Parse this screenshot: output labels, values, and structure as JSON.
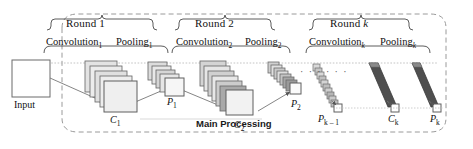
{
  "diagram": {
    "title": "Main Processing",
    "type": "cnn-architecture",
    "container_label": "Main Processing",
    "input": {
      "label": "Input"
    },
    "rounds": [
      {
        "id": "round-1",
        "label": "Round  1",
        "stages": [
          {
            "name": "Convolution",
            "subscript": "1"
          },
          {
            "name": "Pooling",
            "subscript": "1"
          }
        ]
      },
      {
        "id": "round-2",
        "label": "Round  2",
        "stages": [
          {
            "name": "Convolution",
            "subscript": "2"
          },
          {
            "name": "Pooling",
            "subscript": "2"
          }
        ]
      },
      {
        "id": "round-k",
        "label": "Round  k",
        "label_prefix": "Round",
        "label_var": "k",
        "stages": [
          {
            "name": "Convolution",
            "subscript": "k"
          },
          {
            "name": "Pooling",
            "subscript": "k"
          }
        ]
      }
    ],
    "nodes": [
      {
        "id": "c1",
        "symbol": "C",
        "subscript": "1"
      },
      {
        "id": "p1",
        "symbol": "P",
        "subscript": "1"
      },
      {
        "id": "c2",
        "symbol": "C",
        "subscript": "2"
      },
      {
        "id": "p2",
        "symbol": "P",
        "subscript": "2"
      },
      {
        "id": "pk1",
        "symbol": "P",
        "subscript": "k – 1"
      },
      {
        "id": "ck",
        "symbol": "C",
        "subscript": "k"
      },
      {
        "id": "pk",
        "symbol": "P",
        "subscript": "k"
      }
    ],
    "ellipsis": "· · · · · ·",
    "colors": {
      "stroke": "#6b6b6b",
      "feature_map_light": "#f2f2f2",
      "feature_map_mid": "#d8d8d8",
      "feature_map_dark": "#a8a8a8",
      "feature_map_darker": "#6e6e6e",
      "container_border": "#9a9a9a",
      "text": "#111111"
    }
  }
}
